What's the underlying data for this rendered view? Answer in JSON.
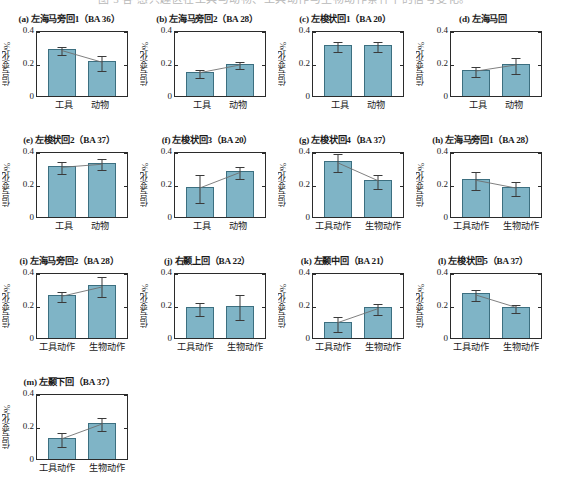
{
  "caption_strip": "图 3  各 感兴趣区在工具与动物、工具动作与生物动作条件下的信号变化。",
  "axis": {
    "ylabel": "信号变化/%",
    "yticks": [
      "0.4",
      "0.2",
      "0"
    ],
    "ymin": 0,
    "ymax": 0.4
  },
  "conditions": {
    "objects": [
      "工具",
      "动物"
    ],
    "actions": [
      "工具动作",
      "生物动作"
    ]
  },
  "chart_data": [
    {
      "type": "bar",
      "panel": "a",
      "title": "(a) 左海马旁回1（BA 36）",
      "region": "左海马旁回1",
      "ba": "BA 36",
      "categories": [
        "工具",
        "动物"
      ],
      "values": [
        0.285,
        0.21
      ],
      "errors": [
        0.025,
        0.045
      ],
      "trend": true,
      "ylabel": "信号变化/%",
      "ylim": [
        0,
        0.4
      ],
      "yticks": [
        0,
        0.2,
        0.4
      ]
    },
    {
      "type": "bar",
      "panel": "b",
      "title": "(b) 左海马旁回2（BA 28）",
      "region": "左海马旁回2",
      "ba": "BA 28",
      "categories": [
        "工具",
        "动物"
      ],
      "values": [
        0.145,
        0.195
      ],
      "errors": [
        0.022,
        0.022
      ],
      "trend": true,
      "ylabel": "信号变化/%",
      "ylim": [
        0,
        0.4
      ],
      "yticks": [
        0,
        0.2,
        0.4
      ]
    },
    {
      "type": "bar",
      "panel": "c",
      "title": "(c) 左梭状回1（BA 20）",
      "region": "左梭状回1",
      "ba": "BA 20",
      "categories": [
        "工具",
        "动物"
      ],
      "values": [
        0.31,
        0.31
      ],
      "errors": [
        0.03,
        0.03
      ],
      "trend": false,
      "ylabel": "信号变化/%",
      "ylim": [
        0,
        0.4
      ],
      "yticks": [
        0,
        0.2,
        0.4
      ]
    },
    {
      "type": "bar",
      "panel": "d",
      "title": "(d) 左海马回",
      "region": "左海马回",
      "ba": "",
      "categories": [
        "工具",
        "动物"
      ],
      "values": [
        0.155,
        0.195
      ],
      "errors": [
        0.03,
        0.05
      ],
      "trend": true,
      "ylabel": "信号变化/%",
      "ylim": [
        0,
        0.4
      ],
      "yticks": [
        0,
        0.2,
        0.4
      ]
    },
    {
      "type": "bar",
      "panel": "e",
      "title": "(e) 左梭状回2（BA 37）",
      "region": "左梭状回2",
      "ba": "BA 37",
      "categories": [
        "工具",
        "动物"
      ],
      "values": [
        0.31,
        0.33
      ],
      "errors": [
        0.035,
        0.032
      ],
      "trend": true,
      "ylabel": "信号变化/%",
      "ylim": [
        0,
        0.4
      ],
      "yticks": [
        0,
        0.2,
        0.4
      ]
    },
    {
      "type": "bar",
      "panel": "f",
      "title": "(f) 左梭状回3（BA 20）",
      "region": "左梭状回3",
      "ba": "BA 20",
      "categories": [
        "工具",
        "动物"
      ],
      "values": [
        0.18,
        0.28
      ],
      "errors": [
        0.085,
        0.038
      ],
      "trend": true,
      "ylabel": "信号变化/%",
      "ylim": [
        0,
        0.4
      ],
      "yticks": [
        0,
        0.2,
        0.4
      ]
    },
    {
      "type": "bar",
      "panel": "g",
      "title": "(g) 左梭状回4（BA 37）",
      "region": "左梭状回4",
      "ba": "BA 37",
      "categories": [
        "工具动作",
        "生物动作"
      ],
      "values": [
        0.34,
        0.225
      ],
      "errors": [
        0.055,
        0.042
      ],
      "trend": true,
      "ylabel": "信号变化/%",
      "ylim": [
        0,
        0.4
      ],
      "yticks": [
        0,
        0.2,
        0.4
      ]
    },
    {
      "type": "bar",
      "panel": "h",
      "title": "(h) 左海马旁回1（BA 28）",
      "region": "左海马旁回1",
      "ba": "BA 28",
      "categories": [
        "工具动作",
        "生物动作"
      ],
      "values": [
        0.23,
        0.18
      ],
      "errors": [
        0.055,
        0.042
      ],
      "trend": true,
      "ylabel": "信号变化/%",
      "ylim": [
        0,
        0.4
      ],
      "yticks": [
        0,
        0.2,
        0.4
      ]
    },
    {
      "type": "bar",
      "panel": "i",
      "title": "(i) 左海马旁回2（BA 28）",
      "region": "左海马旁回2",
      "ba": "BA 28",
      "categories": [
        "工具动作",
        "生物动作"
      ],
      "values": [
        0.26,
        0.32
      ],
      "errors": [
        0.028,
        0.06
      ],
      "trend": true,
      "ylabel": "信号变化/%",
      "ylim": [
        0,
        0.4
      ],
      "yticks": [
        0,
        0.2,
        0.4
      ]
    },
    {
      "type": "bar",
      "panel": "j",
      "title": "(j) 右颞上回（BA 22）",
      "region": "右颞上回",
      "ba": "BA 22",
      "categories": [
        "工具动作",
        "生物动作"
      ],
      "values": [
        0.185,
        0.195
      ],
      "errors": [
        0.04,
        0.075
      ],
      "trend": false,
      "ylabel": "信号变化/%",
      "ylim": [
        0,
        0.4
      ],
      "yticks": [
        0,
        0.2,
        0.4
      ]
    },
    {
      "type": "bar",
      "panel": "k",
      "title": "(k) 左颞中回（BA 21）",
      "region": "左颞中回",
      "ba": "BA 21",
      "categories": [
        "工具动作",
        "生物动作"
      ],
      "values": [
        0.095,
        0.185
      ],
      "errors": [
        0.045,
        0.032
      ],
      "trend": true,
      "ylabel": "信号变化/%",
      "ylim": [
        0,
        0.4
      ],
      "yticks": [
        0,
        0.2,
        0.4
      ]
    },
    {
      "type": "bar",
      "panel": "l",
      "title": "(l) 左梭状回5（BA 37）",
      "region": "左梭状回5",
      "ba": "BA 37",
      "categories": [
        "工具动作",
        "生物动作"
      ],
      "values": [
        0.27,
        0.19
      ],
      "errors": [
        0.035,
        0.025
      ],
      "trend": true,
      "ylabel": "信号变化/%",
      "ylim": [
        0,
        0.4
      ],
      "yticks": [
        0,
        0.2,
        0.4
      ]
    },
    {
      "type": "bar",
      "panel": "m",
      "title": "(m) 左颞下回（BA 37）",
      "region": "左颞下回",
      "ba": "BA 37",
      "categories": [
        "工具动作",
        "生物动作"
      ],
      "values": [
        0.125,
        0.22
      ],
      "errors": [
        0.042,
        0.038
      ],
      "trend": true,
      "ylabel": "信号变化/%",
      "ylim": [
        0,
        0.4
      ],
      "yticks": [
        0,
        0.2,
        0.4
      ]
    }
  ],
  "colors": {
    "bar_fill": "#7fb4c6",
    "bar_stroke": "#3c6f80",
    "axis": "#2b2b2b",
    "error": "#3a3a3a",
    "trend": "#6e6e6e"
  }
}
